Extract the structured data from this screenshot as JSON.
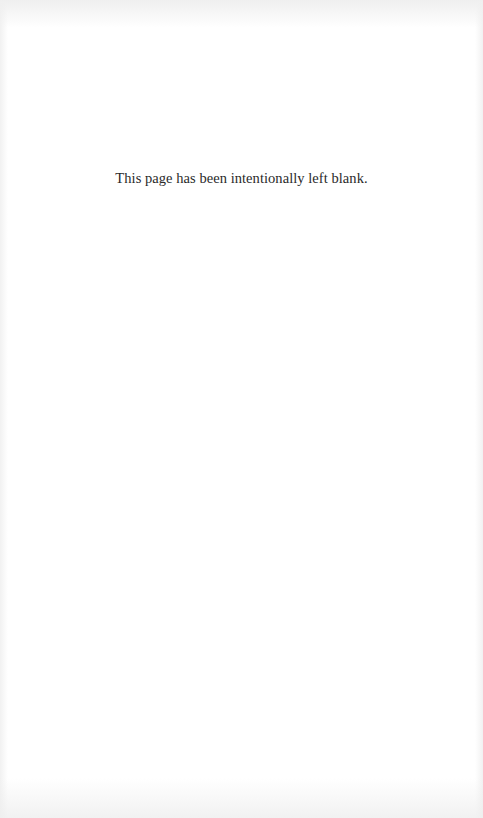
{
  "page": {
    "notice": "This page has been intentionally left blank."
  }
}
